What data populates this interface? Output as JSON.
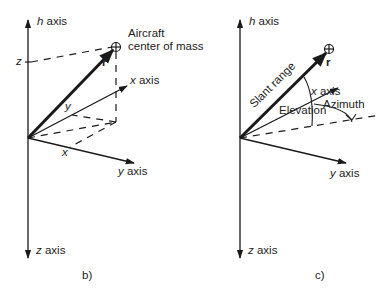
{
  "figures": [
    {
      "id": "b",
      "caption": "b)",
      "labels": {
        "h_axis_var": "h",
        "h_axis_word": "axis",
        "x_axis_var": "x",
        "x_axis_word": "axis",
        "y_axis_var": "y",
        "y_axis_word": "axis",
        "z_axis_var": "z",
        "z_axis_word": "axis",
        "aircraft_line1": "Aircraft",
        "aircraft_line2": "center of mass",
        "r_vector": "r",
        "z_component": "z",
        "y_component": "y",
        "x_component": "x"
      }
    },
    {
      "id": "c",
      "caption": "c)",
      "labels": {
        "h_axis_var": "h",
        "h_axis_word": "axis",
        "x_axis_var": "x",
        "x_axis_word": "axis",
        "y_axis_var": "y",
        "y_axis_word": "axis",
        "z_axis_var": "z",
        "z_axis_word": "axis",
        "r_vector": "r",
        "slant_range": "Slant range",
        "elevation": "Elevation",
        "azimuth": "Azimuth"
      }
    }
  ],
  "colors": {
    "line": "#1a1a1a",
    "background": "#ffffff"
  }
}
